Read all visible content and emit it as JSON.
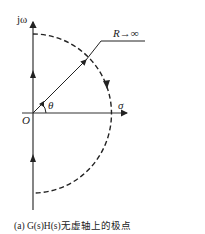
{
  "diagram": {
    "axis_labels": {
      "vertical": "jω",
      "horizontal": "σ",
      "origin": "O"
    },
    "radius_label": "R→∞",
    "angle_label": "θ",
    "caption": "(a) G(s)H(s)无虚轴上的极点",
    "colors": {
      "stroke": "#222222",
      "background": "#ffffff"
    }
  }
}
